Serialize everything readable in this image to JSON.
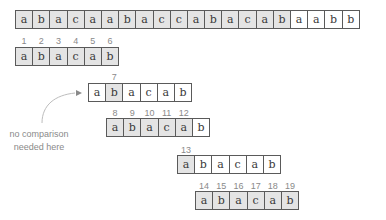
{
  "text_row": {
    "cells": [
      "a",
      "b",
      "a",
      "c",
      "a",
      "a",
      "b",
      "a",
      "c",
      "c",
      "a",
      "b",
      "a",
      "c",
      "a",
      "b",
      "a",
      "a",
      "b",
      "b"
    ],
    "shaded": [
      true,
      true,
      true,
      true,
      true,
      true,
      true,
      true,
      true,
      true,
      true,
      true,
      true,
      true,
      true,
      true,
      false,
      false,
      false,
      false
    ]
  },
  "pattern_rows": [
    {
      "cells": [
        "a",
        "b",
        "a",
        "c",
        "a",
        "b"
      ],
      "shaded": [
        true,
        true,
        true,
        true,
        true,
        true
      ],
      "numbers": [
        "1",
        "2",
        "3",
        "4",
        "5",
        "6"
      ]
    },
    {
      "cells": [
        "a",
        "b",
        "a",
        "c",
        "a",
        "b"
      ],
      "shaded": [
        false,
        true,
        false,
        false,
        false,
        false
      ],
      "numbers": [
        "",
        "7",
        "",
        "",
        "",
        ""
      ]
    },
    {
      "cells": [
        "a",
        "b",
        "a",
        "c",
        "a",
        "b"
      ],
      "shaded": [
        true,
        true,
        true,
        true,
        true,
        false
      ],
      "numbers": [
        "8",
        "9",
        "10",
        "11",
        "12",
        ""
      ]
    },
    {
      "cells": [
        "a",
        "b",
        "a",
        "c",
        "a",
        "b"
      ],
      "shaded": [
        true,
        false,
        false,
        false,
        false,
        false
      ],
      "numbers": [
        "13",
        "",
        "",
        "",
        "",
        ""
      ]
    },
    {
      "cells": [
        "a",
        "b",
        "a",
        "c",
        "a",
        "b"
      ],
      "shaded": [
        true,
        true,
        true,
        true,
        true,
        true
      ],
      "numbers": [
        "14",
        "15",
        "16",
        "17",
        "18",
        "19"
      ]
    }
  ],
  "annotation": {
    "line1": "no comparison",
    "line2": "needed here"
  },
  "colors": {
    "shaded_fill": "#e4e4e4",
    "border": "#5a5a5a",
    "number_text": "#8a8a8a"
  }
}
